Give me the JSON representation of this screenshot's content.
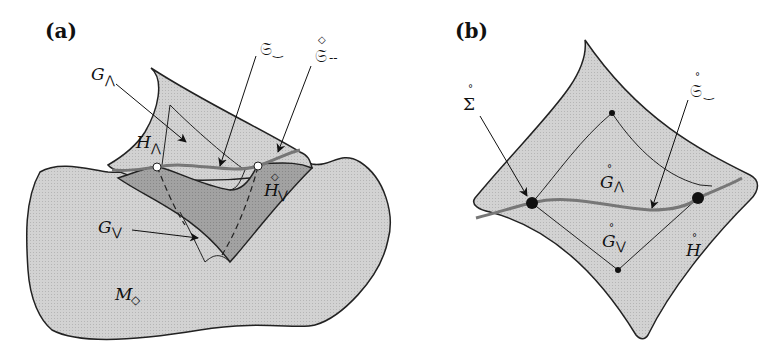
{
  "colors": {
    "surface_light": "#cfcfcf",
    "surface_dark": "#9d9d9d",
    "outline": "#222222",
    "curve": "#7a7a7a",
    "background": "#ffffff"
  },
  "panel_a": {
    "label": "(a)",
    "labels": {
      "G_wedge": {
        "base": "G",
        "sub": "⋀"
      },
      "H_wedge": {
        "base": "H",
        "sub": "⋀"
      },
      "S_smile": {
        "base": "𝔖",
        "sub": "‿"
      },
      "S_dash": {
        "base": "𝔖",
        "ring": "◇",
        "sub": "--"
      },
      "H_vee": {
        "base": "H",
        "ring": "◇",
        "sub": "⋁"
      },
      "G_vee": {
        "base": "G",
        "sub": "⋁"
      },
      "M_diamond": {
        "base": "M",
        "sub": "◇"
      }
    }
  },
  "panel_b": {
    "label": "(b)",
    "labels": {
      "Sigma": {
        "base": "Σ",
        "ring": "°"
      },
      "S_smile": {
        "base": "𝔖",
        "ring": "°",
        "sub": "‿"
      },
      "G_wedge": {
        "base": "G",
        "ring": "°",
        "sub": "⋀"
      },
      "G_vee": {
        "base": "G",
        "ring": "°",
        "sub": "⋁"
      },
      "H": {
        "base": "H",
        "ring": "°"
      }
    }
  }
}
